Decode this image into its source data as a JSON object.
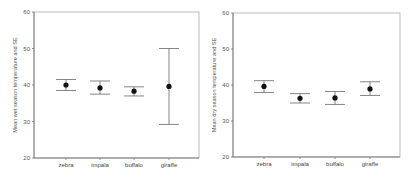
{
  "chart_data": [
    {
      "type": "scatter",
      "subtype": "errorbar",
      "title": "",
      "xlabel": "",
      "ylabel": "Mean wet season temperature and SE",
      "categories": [
        "zebra",
        "impala",
        "buffalo",
        "giraffe"
      ],
      "series": [
        {
          "name": "Mean wet season temperature",
          "values": [
            40.0,
            39.2,
            38.3,
            39.6
          ],
          "lower": [
            38.5,
            37.5,
            37.0,
            29.2
          ],
          "upper": [
            41.5,
            41.1,
            39.5,
            50.0
          ]
        }
      ],
      "ylim": [
        20,
        60
      ],
      "yticks": [
        20,
        30,
        40,
        50,
        60
      ],
      "grid": false,
      "legend": "none"
    },
    {
      "type": "scatter",
      "subtype": "errorbar",
      "title": "",
      "xlabel": "",
      "ylabel": "Mean dry season temperature and SE",
      "categories": [
        "zebra",
        "impala",
        "buffalo",
        "giraffe"
      ],
      "series": [
        {
          "name": "Mean dry season temperature",
          "values": [
            39.6,
            36.3,
            36.4,
            38.9
          ],
          "lower": [
            37.9,
            35.0,
            34.6,
            37.1
          ],
          "upper": [
            41.2,
            37.6,
            38.2,
            40.9
          ]
        }
      ],
      "ylim": [
        20,
        60
      ],
      "yticks": [
        20,
        30,
        40,
        50,
        60
      ],
      "grid": false,
      "legend": "none"
    }
  ],
  "colors": {
    "axis": "#777777",
    "frame": "#aaaaaa",
    "marker": "#111111",
    "errorbar": "#666666"
  }
}
